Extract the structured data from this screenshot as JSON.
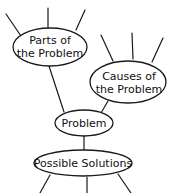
{
  "diagram": {
    "type": "web-organizer",
    "nodes": {
      "parts": {
        "line1": "Parts of",
        "line2": "the Problem"
      },
      "causes": {
        "line1": "Causes of",
        "line2": "the Problem"
      },
      "problem": {
        "label": "Problem"
      },
      "solutions": {
        "label": "Possible Solutions"
      }
    },
    "colors": {
      "stroke": "#1a1a1a",
      "background": "#ffffff",
      "text": "#111111"
    }
  }
}
